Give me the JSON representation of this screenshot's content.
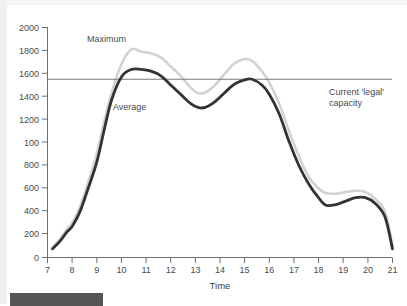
{
  "chart_data": {
    "type": "line",
    "title": "",
    "xlabel": "Time",
    "ylabel": "",
    "xlim": [
      7,
      21
    ],
    "ylim": [
      0,
      2000
    ],
    "grid": false,
    "legend_position": "inline-annotations",
    "x_ticks": [
      "7",
      "8",
      "9",
      "10",
      "11",
      "12",
      "13",
      "14",
      "15",
      "16",
      "17",
      "18",
      "19",
      "20",
      "21"
    ],
    "y_ticks": [
      "0",
      "200",
      "400",
      "600",
      "800",
      "100",
      "1200",
      "1400",
      "1600",
      "1800",
      "2000"
    ],
    "y_tick_values": [
      0,
      200,
      400,
      600,
      800,
      1000,
      1200,
      1400,
      1600,
      1800,
      2000
    ],
    "x": [
      7.2,
      7.5,
      7.8,
      8.0,
      8.3,
      8.6,
      9.0,
      9.3,
      9.6,
      10.0,
      10.4,
      10.8,
      11.2,
      11.6,
      12.0,
      12.4,
      12.8,
      13.1,
      13.4,
      13.8,
      14.2,
      14.6,
      15.0,
      15.3,
      15.7,
      16.0,
      16.4,
      16.8,
      17.2,
      17.6,
      18.0,
      18.3,
      18.7,
      19.1,
      19.5,
      19.9,
      20.3,
      20.7,
      21.0
    ],
    "series": [
      {
        "name": "Maximum",
        "color": "#d2d2d2",
        "values": [
          90,
          160,
          250,
          300,
          430,
          620,
          900,
          1180,
          1430,
          1680,
          1810,
          1790,
          1775,
          1740,
          1660,
          1580,
          1480,
          1430,
          1435,
          1500,
          1600,
          1690,
          1725,
          1710,
          1620,
          1520,
          1340,
          1100,
          880,
          700,
          600,
          560,
          555,
          570,
          580,
          570,
          510,
          400,
          100
        ]
      },
      {
        "name": "Average",
        "color": "#333333",
        "values": [
          75,
          140,
          225,
          270,
          390,
          570,
          830,
          1110,
          1370,
          1570,
          1635,
          1635,
          1620,
          1580,
          1500,
          1420,
          1340,
          1305,
          1305,
          1355,
          1435,
          1510,
          1545,
          1550,
          1500,
          1420,
          1250,
          1010,
          800,
          640,
          520,
          455,
          460,
          490,
          520,
          520,
          470,
          350,
          75
        ]
      }
    ],
    "annotations": [
      {
        "name": "maximum-label",
        "text": "Maximum"
      },
      {
        "name": "average-label",
        "text": "Average"
      },
      {
        "name": "capacity-label",
        "text_line1": "Current 'legal'",
        "text_line2": "capacity"
      }
    ],
    "reference_line": {
      "label": "Current 'legal' capacity",
      "value": 1550,
      "color": "#6e6e6e"
    }
  },
  "axis": {
    "x_title": "Time",
    "axis_color": "#6e6e6e"
  }
}
